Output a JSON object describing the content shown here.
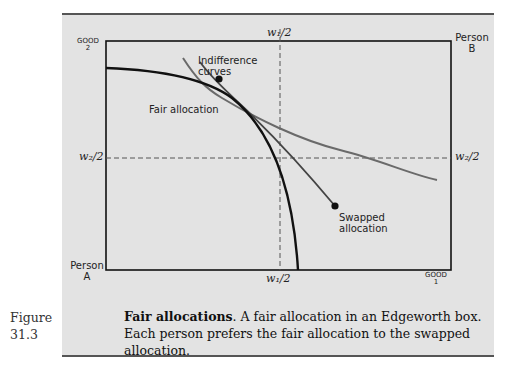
{
  "figure": {
    "number_label": "Figure",
    "number": "31.3",
    "caption_title": "Fair allocations",
    "caption_text": ". A fair allocation in an Edgeworth box. Each person prefers the fair allocation to the swapped allocation."
  },
  "diagram": {
    "type": "edgeworth-box",
    "axis_labels": {
      "good2_line1": "GOOD",
      "good2_line2": "2",
      "good1_line1": "GOOD",
      "good1_line2": "1",
      "person_a_line1": "Person",
      "person_a_line2": "A",
      "person_b_line1": "Person",
      "person_b_line2": "B"
    },
    "dashed_lines": {
      "w1_top": "w₁/2",
      "w1_bottom": "w₁/2",
      "w2_left": "w₂/2",
      "w2_right": "w₂/2"
    },
    "annotations": {
      "indifference_line1": "Indifference",
      "indifference_line2": "curves",
      "fair": "Fair allocation",
      "swapped_line1": "Swapped",
      "swapped_line2": "allocation"
    },
    "colors": {
      "panel_bg": "#e3e3e3",
      "frontier": "#111111",
      "indifference": "#6a6a6a",
      "box": "#111111"
    }
  }
}
